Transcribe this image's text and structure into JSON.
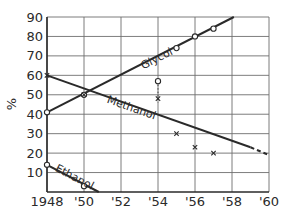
{
  "chart_data": {
    "type": "line",
    "title": "",
    "xlabel": "",
    "ylabel": "%",
    "xlim": [
      1948,
      1960
    ],
    "ylim": [
      0,
      90
    ],
    "grid": true,
    "legend": "inline labels on lines",
    "x_ticks": [
      "1948",
      "'50",
      "'52",
      "'54",
      "'56",
      "'58",
      "'60"
    ],
    "x_tick_values": [
      1948,
      1950,
      1952,
      1954,
      1956,
      1958,
      1960
    ],
    "y_ticks": [
      "10",
      "20",
      "30",
      "40",
      "50",
      "60",
      "70",
      "80",
      "90"
    ],
    "y_tick_values": [
      10,
      20,
      30,
      40,
      50,
      60,
      70,
      80,
      90
    ],
    "series": [
      {
        "name": "Glycol",
        "marker": "circle",
        "points": [
          [
            1948,
            41
          ],
          [
            1950,
            50
          ],
          [
            1955,
            74
          ],
          [
            1956,
            80
          ],
          [
            1957,
            84
          ]
        ],
        "outliers": [
          [
            1954,
            57
          ]
        ],
        "line": [
          [
            1948,
            41
          ],
          [
            1958.1,
            90
          ]
        ],
        "label_pos": [
          1953.2,
          63
        ]
      },
      {
        "name": "Methanol",
        "marker": "x",
        "points": [
          [
            1948,
            60
          ],
          [
            1950,
            50
          ],
          [
            1955,
            30
          ],
          [
            1956,
            23
          ],
          [
            1957,
            20
          ]
        ],
        "outliers": [
          [
            1954,
            48
          ]
        ],
        "line": [
          [
            1948,
            60
          ],
          [
            1959,
            23
          ]
        ],
        "dashed_extension": [
          [
            1959,
            23
          ],
          [
            1960,
            19
          ]
        ],
        "label_pos": [
          1951.2,
          46
        ]
      },
      {
        "name": "Ethanol",
        "marker": "circle",
        "points": [
          [
            1948,
            14
          ],
          [
            1950,
            3
          ]
        ],
        "line": [
          [
            1948,
            14
          ],
          [
            1950.8,
            0
          ]
        ],
        "label_pos": [
          1948.4,
          11
        ]
      }
    ],
    "annotations": [
      {
        "type": "dotted-vertical",
        "x": 1954,
        "from": 46,
        "to": 57
      }
    ]
  }
}
